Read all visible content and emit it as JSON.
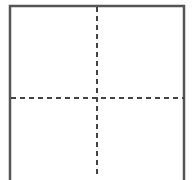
{
  "diagram": {
    "shape": "box-open-bottom",
    "border_color": "#555555",
    "dash_color": "#444444",
    "border_width": 2.5,
    "dash_width": 2,
    "dash_pattern": "5,4",
    "box": {
      "left": 10,
      "top": 6,
      "right": 184,
      "bottom": 180
    },
    "divider_vertical_x": 97,
    "divider_horizontal_y": 98
  }
}
